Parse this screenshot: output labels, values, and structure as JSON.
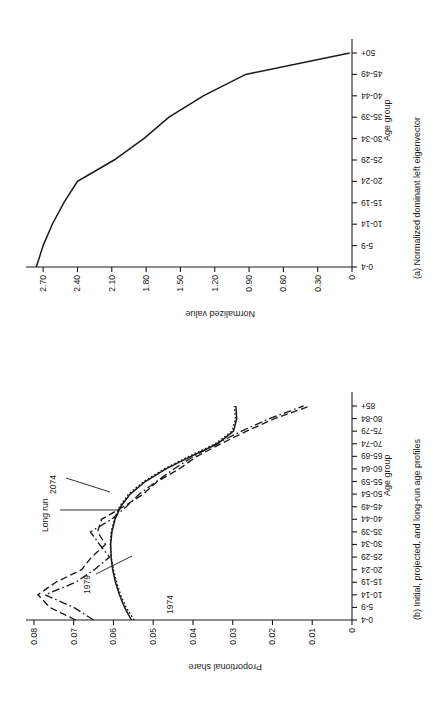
{
  "figure": {
    "orientation": "rotated-90-ccw",
    "panel_a_caption": "(a) Normalized dominant left eigenvector",
    "panel_b_caption": "(b) Initial, projected, and long-run age profiles"
  },
  "chart_data": [
    {
      "type": "line",
      "panel": "a",
      "title": "(a) Normalized dominant left eigenvector",
      "xlabel": "Age group",
      "ylabel": "Normalized value",
      "ylim": [
        0,
        2.85
      ],
      "yticks": [
        0,
        0.3,
        0.6,
        0.9,
        1.2,
        1.5,
        1.8,
        2.1,
        2.4,
        2.7
      ],
      "ytick_labels": [
        "0",
        "0.30",
        "0.60",
        "0.90",
        "1.20",
        "1.50",
        "1.80",
        "2.10",
        "2.40",
        "2.70"
      ],
      "grid": false,
      "legend": "none",
      "categories": [
        "0-4",
        "5-9",
        "10-14",
        "15-19",
        "20-24",
        "25-29",
        "30-34",
        "35-39",
        "40-44",
        "45-49",
        "50+"
      ],
      "series": [
        {
          "name": "Normalized dominant left eigenvector",
          "style": "solid",
          "values": [
            2.76,
            2.7,
            2.62,
            2.52,
            2.4,
            2.08,
            1.82,
            1.6,
            1.3,
            0.93,
            0.02
          ]
        }
      ]
    },
    {
      "type": "line",
      "panel": "b",
      "title": "(b) Initial, projected, and long-run age profiles",
      "xlabel": "Age group",
      "ylabel": "Proportional share",
      "ylim": [
        0,
        0.082
      ],
      "yticks": [
        0,
        0.01,
        0.02,
        0.03,
        0.04,
        0.05,
        0.06,
        0.07,
        0.08
      ],
      "ytick_labels": [
        "0",
        "0.01",
        "0.02",
        "0.03",
        "0.04",
        "0.05",
        "0.06",
        "0.07",
        "0.08"
      ],
      "grid": false,
      "legend": "inline-annotations",
      "categories": [
        "0-4",
        "5-9",
        "10-14",
        "15-19",
        "20-24",
        "25-29",
        "30-34",
        "35-39",
        "40-44",
        "45-49",
        "50-54",
        "55-59",
        "60-64",
        "65-69",
        "70-74",
        "75-79",
        "80-84",
        "85+"
      ],
      "series": [
        {
          "name": "1974",
          "style": "dashed",
          "label": "1974",
          "values": [
            0.0695,
            0.076,
            0.079,
            0.0745,
            0.068,
            0.0655,
            0.062,
            0.064,
            0.063,
            0.0575,
            0.0525,
            0.049,
            0.0435,
            0.039,
            0.033,
            0.0265,
            0.0195,
            0.0105
          ]
        },
        {
          "name": "1979",
          "style": "dash-dot",
          "label": "1979",
          "values": [
            0.065,
            0.07,
            0.0772,
            0.0695,
            0.0648,
            0.061,
            0.0635,
            0.0658,
            0.0605,
            0.0568,
            0.0535,
            0.0492,
            0.0448,
            0.0398,
            0.0342,
            0.0278,
            0.0208,
            0.0122
          ]
        },
        {
          "name": "Long run",
          "style": "solid",
          "label": "Long run",
          "values": [
            0.0555,
            0.0572,
            0.0585,
            0.0595,
            0.0602,
            0.0606,
            0.0607,
            0.0604,
            0.0596,
            0.0582,
            0.0558,
            0.052,
            0.0468,
            0.0405,
            0.0338,
            0.0298,
            0.029,
            0.0292
          ]
        },
        {
          "name": "2074",
          "style": "dotted",
          "label": "2074",
          "values": [
            0.0548,
            0.0568,
            0.0582,
            0.0592,
            0.06,
            0.0606,
            0.0608,
            0.0606,
            0.0598,
            0.0585,
            0.0562,
            0.0524,
            0.0472,
            0.041,
            0.0344,
            0.0302,
            0.0293,
            0.0296
          ]
        }
      ],
      "annotations": [
        {
          "text": "1974",
          "series": "1974"
        },
        {
          "text": "1979",
          "series": "1979"
        },
        {
          "text": "Long run",
          "series": "Long run"
        },
        {
          "text": "2074",
          "series": "2074"
        }
      ]
    }
  ],
  "panel_a": {
    "caption": "(a) Normalized dominant left eigenvector",
    "xaxis_title": "Age group",
    "yaxis_title": "Normalized value",
    "ytick_labels": [
      "0",
      "0.30",
      "0.60",
      "0.90",
      "1.20",
      "1.50",
      "1.80",
      "2.10",
      "2.40",
      "2.70"
    ],
    "xtick_labels": [
      "0-4",
      "5-9",
      "10-14",
      "15-19",
      "20-24",
      "25-29",
      "30-34",
      "35-39",
      "40-44",
      "45-49",
      "50+"
    ]
  },
  "panel_b": {
    "caption": "(b) Initial, projected, and long-run age profiles",
    "xaxis_title": "Age group",
    "yaxis_title": "Proportional share",
    "ytick_labels": [
      "0",
      "0.01",
      "0.02",
      "0.03",
      "0.04",
      "0.05",
      "0.06",
      "0.07",
      "0.08"
    ],
    "xtick_labels": [
      "0-4",
      "5-9",
      "10-14",
      "15-19",
      "20-24",
      "25-29",
      "30-34",
      "35-39",
      "40-44",
      "45-49",
      "50-54",
      "55-59",
      "60-64",
      "65-69",
      "70-74",
      "75-79",
      "80-84",
      "85+"
    ],
    "labels": {
      "l1974": "1974",
      "l1979": "1979",
      "longrun": "Long run",
      "l2074": "2074"
    }
  }
}
